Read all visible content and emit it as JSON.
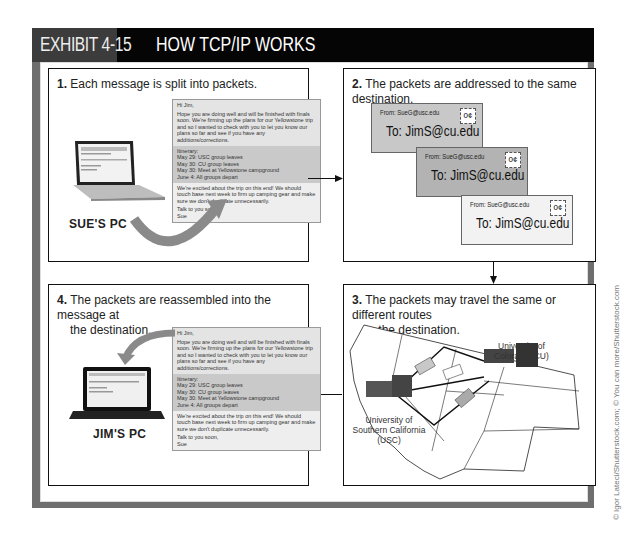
{
  "header": {
    "exhibit": "EXHIBIT 4-15",
    "title": "HOW TCP/IP WORKS"
  },
  "panels": [
    {
      "number": "1.",
      "text": "Each message is split into packets.",
      "pc_label": "SUE'S PC"
    },
    {
      "number": "2.",
      "text": "The packets are addressed to the same destination.",
      "envelopes": [
        {
          "from": "From: SueG@usc.edu",
          "to": "To: JimS@cu.edu",
          "stamp": "0¢",
          "color": "#c8c8c8"
        },
        {
          "from": "From: SueG@usc.edu",
          "to": "To: JimS@cu.edu",
          "stamp": "0¢",
          "color": "#b3b3b3"
        },
        {
          "from": "From: SueG@usc.edu",
          "to": "To: JimS@cu.edu",
          "stamp": "0¢",
          "color": "#f2f2f2"
        }
      ]
    },
    {
      "number": "3.",
      "text": "The packets may travel the same or different routes",
      "text2": "to the destination.",
      "map_labels": {
        "dest": "University of Colorado (CU)",
        "dest_l1": "University of",
        "dest_l2": "Colorado (CU)",
        "origin_l1": "University of",
        "origin_l2": "Southern California",
        "origin_l3": "(USC)"
      }
    },
    {
      "number": "4.",
      "text": "The packets are reassembled into the message at",
      "text2": "the destination.",
      "pc_label": "JIM'S PC"
    }
  ],
  "message": {
    "greeting": "Hi Jim,",
    "para1": "Hope you are doing well and will be finished with finals soon. We're firming up the plans for our Yellowstone trip and so I wanted to check with you to let you know our plans so far and see if you have any additions/corrections.",
    "itinerary_title": "Itinerary:",
    "itinerary": [
      "May 29: USC group leaves",
      "May 30: CU group leaves",
      "May 30: Meet at Yellowstone campground",
      "June 4: All groups depart"
    ],
    "para2": "We're excited about the trip on this end! We should touch base next week to firm up camping gear and make sure we don't duplicate unnecessarily.",
    "closing": "Talk to you soon,",
    "signature": "Sue"
  },
  "credit": "© Igor Lateci/Shutterstock.com; © You can more/Shutterstock.com"
}
